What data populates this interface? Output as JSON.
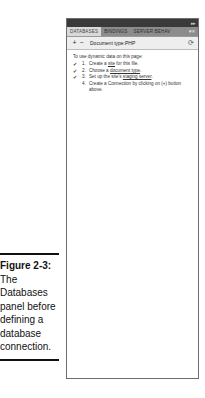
{
  "panel": {
    "tabs": [
      {
        "label": "DATABASES",
        "active": true
      },
      {
        "label": "BINDINGS",
        "active": false
      },
      {
        "label": "SERVER BEHAV",
        "active": false
      }
    ],
    "menu_icon": "panel-menu-icon",
    "toolbar": {
      "add_label": "+",
      "remove_label": "−",
      "document_type": "Document type:PHP",
      "refresh_icon": "⟳"
    },
    "content": {
      "intro": "To use dynamic data on this page:",
      "steps": [
        {
          "checked": true,
          "num": "1.",
          "pre": "Create a ",
          "link": "site",
          "post": " for this file."
        },
        {
          "checked": true,
          "num": "2.",
          "pre": "Choose a ",
          "link": "document type",
          "post": "."
        },
        {
          "checked": true,
          "num": "3.",
          "pre": "Set up the site's ",
          "link": "staging server",
          "post": "."
        },
        {
          "checked": false,
          "num": "4.",
          "pre": "Create a Connection by clicking on (+) button above.",
          "link": "",
          "post": ""
        }
      ],
      "check_glyph": "✔"
    }
  },
  "caption": {
    "label": "Figure 2-3:",
    "text": "The Databases panel before defining a database connection."
  }
}
